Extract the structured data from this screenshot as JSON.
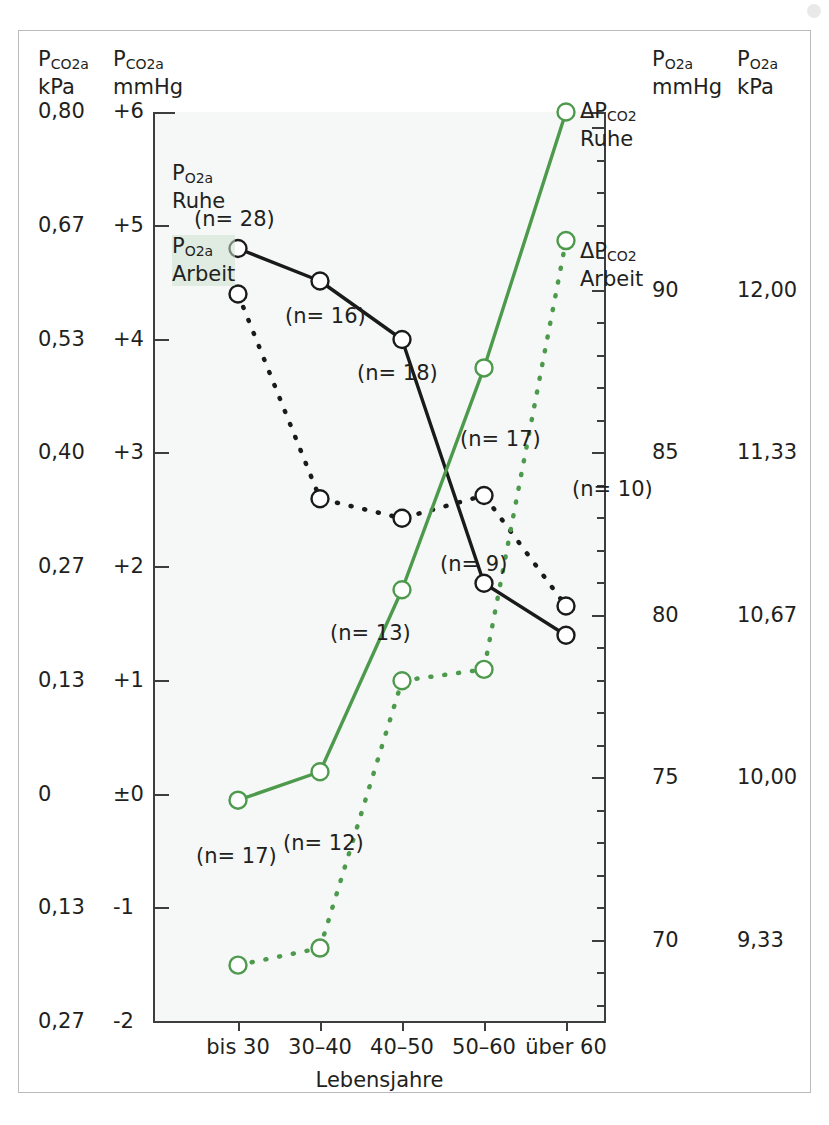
{
  "figure": {
    "background": "#f6f8f7",
    "frame_color": "#b9bcbe",
    "axis_color": "#3d3d3d",
    "green": "#4d9a4d",
    "black": "#1a1a1a"
  },
  "headers": {
    "left_kpa_line1": "P",
    "left_kpa_sub": "CO2a",
    "left_kpa_unit": "kPa",
    "left_mmhg_line1": "P",
    "left_mmhg_sub": "CO2a",
    "left_mmhg_unit": "mmHg",
    "right_mmhg_line1": "P",
    "right_mmhg_sub": "O2a",
    "right_mmhg_unit": "mmHg",
    "right_kpa_line1": "P",
    "right_kpa_sub": "O2a",
    "right_kpa_unit": "kPa"
  },
  "chart_data": {
    "type": "line",
    "title": "",
    "xlabel": "Lebensjahre",
    "ylabel": "PCO2a mmHg",
    "categories": [
      "bis 30",
      "30-40",
      "40-50",
      "50-60",
      "über 60"
    ],
    "left_axis_mmHg": {
      "ticks": [
        "+6",
        "+5",
        "+4",
        "+3",
        "+2",
        "+1",
        "±0",
        "-1",
        "-2"
      ],
      "values": [
        6,
        5,
        4,
        3,
        2,
        1,
        0,
        -1,
        -2
      ],
      "ylim": [
        -2,
        6
      ],
      "unit": "mmHg"
    },
    "left_axis_kPa": {
      "ticks": [
        "0,80",
        "0,67",
        "0,53",
        "0,40",
        "0,27",
        "0,13",
        "0",
        "0,13",
        "0,27"
      ],
      "values": [
        0.8,
        0.67,
        0.53,
        0.4,
        0.27,
        0.13,
        0,
        0.13,
        0.27
      ],
      "unit": "kPa"
    },
    "right_axis_mmHg": {
      "ticks": [
        "90",
        "85",
        "80",
        "75",
        "70"
      ],
      "values": [
        90,
        85,
        80,
        75,
        70
      ],
      "ylim": [
        67.5,
        95.5
      ],
      "unit": "mmHg"
    },
    "right_axis_kPa": {
      "ticks": [
        "12,00",
        "11,33",
        "10,67",
        "10,00",
        "9,33"
      ],
      "values": [
        12.0,
        11.33,
        10.67,
        10.0,
        9.33
      ],
      "unit": "kPa"
    },
    "grid": false,
    "legend_position": "inline-annotations",
    "series": [
      {
        "name": "PO2a Ruhe",
        "axis": "right",
        "color": "#1a1a1a",
        "style": "solid",
        "marker": "open-circle",
        "unit": "mmHg",
        "values": [
          91.3,
          90.3,
          88.5,
          81.0,
          79.4
        ],
        "n_labels": [
          "(n= 28)",
          "",
          "(n= 18)",
          "(n= 17)",
          ""
        ]
      },
      {
        "name": "PO2a Arbeit",
        "axis": "right",
        "color": "#1a1a1a",
        "style": "dashed",
        "marker": "open-circle",
        "unit": "mmHg",
        "values": [
          89.9,
          83.6,
          83.0,
          83.7,
          80.3
        ],
        "n_labels": [
          "",
          "(n= 16)",
          "",
          "",
          "(n= 10)"
        ]
      },
      {
        "name": "ΔPCO2 Ruhe",
        "axis": "left",
        "color": "#4d9a4d",
        "style": "solid",
        "marker": "open-circle",
        "unit": "mmHg",
        "values": [
          -0.05,
          0.2,
          1.8,
          3.75,
          6.0
        ],
        "n_labels": [
          "(n= 17)",
          "",
          "(n= 13)",
          "",
          ""
        ]
      },
      {
        "name": "ΔPCO2 Arbeit",
        "axis": "left",
        "color": "#4d9a4d",
        "style": "dashed",
        "marker": "open-circle",
        "unit": "mmHg",
        "values": [
          -1.5,
          -1.35,
          1.0,
          1.1,
          4.87
        ],
        "n_labels": [
          "",
          "(n= 12)",
          "",
          "(n= 9)",
          ""
        ]
      }
    ]
  },
  "annotations": {
    "po2a_ruhe_p": "P",
    "po2a_ruhe_sub": "O2a",
    "po2a_ruhe_label": "Ruhe",
    "po2a_n28": "(n= 28)",
    "po2a_arbeit_p": "P",
    "po2a_arbeit_sub": "O2a",
    "po2a_arbeit_label": "Arbeit",
    "n16": "(n= 16)",
    "n18": "(n= 18)",
    "n17_black": "(n= 17)",
    "n10": "(n= 10)",
    "n13": "(n= 13)",
    "n9": "(n= 9)",
    "n17_green": "(n= 17)",
    "n12": "(n= 12)",
    "dpco2_ruhe_delta": "ΔP",
    "dpco2_ruhe_sub": "CO2",
    "dpco2_ruhe_label": "Ruhe",
    "dpco2_arbeit_delta": "ΔP",
    "dpco2_arbeit_sub": "CO2",
    "dpco2_arbeit_label": "Arbeit"
  },
  "xaxis": {
    "title": "Lebensjahre",
    "labels": [
      "bis 30",
      "30–40",
      "40–50",
      "50–60",
      "über 60"
    ]
  }
}
